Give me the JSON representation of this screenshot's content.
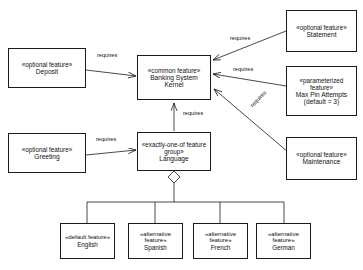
{
  "diagram": {
    "type": "uml-feature-model",
    "nodes": [
      {
        "id": "deposit",
        "stereotype": "«optional feature»",
        "name": "Deposit",
        "x": 8,
        "y": 48,
        "w": 78,
        "h": 40
      },
      {
        "id": "greeting",
        "stereotype": "«optional feature»",
        "name": "Greeting",
        "x": 8,
        "y": 133,
        "w": 78,
        "h": 40
      },
      {
        "id": "kernel",
        "stereotype": "«common feature»",
        "name": "Banking System Kernel",
        "x": 137,
        "y": 55,
        "w": 74,
        "h": 45
      },
      {
        "id": "language",
        "stereotype": "«exactly-one-of feature group»",
        "name": "Language",
        "x": 137,
        "y": 132,
        "w": 74,
        "h": 39
      },
      {
        "id": "statement",
        "stereotype": "«optional feature»",
        "name": "Statement",
        "x": 286,
        "y": 10,
        "w": 71,
        "h": 42
      },
      {
        "id": "maxpin",
        "stereotype": "«parameterized feature»",
        "name": "Max Pin Attempts (default = 3)",
        "x": 286,
        "y": 66,
        "w": 71,
        "h": 50
      },
      {
        "id": "maintenance",
        "stereotype": "«optional feature»",
        "name": "Maintenance",
        "x": 286,
        "y": 137,
        "w": 71,
        "h": 43
      },
      {
        "id": "english",
        "stereotype": "«default feature»",
        "name": "English",
        "x": 60,
        "y": 223,
        "w": 55,
        "h": 36
      },
      {
        "id": "spanish",
        "stereotype": "«alternative feature»",
        "name": "Spanish",
        "x": 128,
        "y": 223,
        "w": 55,
        "h": 36
      },
      {
        "id": "french",
        "stereotype": "«alternative feature»",
        "name": "French",
        "x": 193,
        "y": 223,
        "w": 55,
        "h": 36
      },
      {
        "id": "german",
        "stereotype": "«alternative feature»",
        "name": "German",
        "x": 256,
        "y": 223,
        "w": 55,
        "h": 36
      }
    ],
    "edges": [
      {
        "id": "deposit-kernel",
        "from": "deposit",
        "to": "kernel",
        "label": "requires"
      },
      {
        "id": "statement-kernel",
        "from": "statement",
        "to": "kernel",
        "label": "requires"
      },
      {
        "id": "maxpin-kernel",
        "from": "maxpin",
        "to": "kernel",
        "label": "requires"
      },
      {
        "id": "maintenance-kernel",
        "from": "maintenance",
        "to": "kernel",
        "label": "requires"
      },
      {
        "id": "language-kernel",
        "from": "language",
        "to": "kernel",
        "label": "requires"
      },
      {
        "id": "greeting-language",
        "from": "greeting",
        "to": "language",
        "label": "requires"
      }
    ],
    "edge_labels": {
      "deposit": "requires",
      "statement": "requires",
      "maxpin": "requires",
      "maintenance": "requires",
      "language": "requires",
      "greeting": "requires"
    },
    "group": {
      "parent": "language",
      "marker": "diamond",
      "children": [
        "english",
        "spanish",
        "french",
        "german"
      ]
    },
    "colors": {
      "stroke": "#1a1a1a",
      "fill": "#ffffff",
      "text": "#111111"
    }
  },
  "caption": {
    "text": ""
  }
}
